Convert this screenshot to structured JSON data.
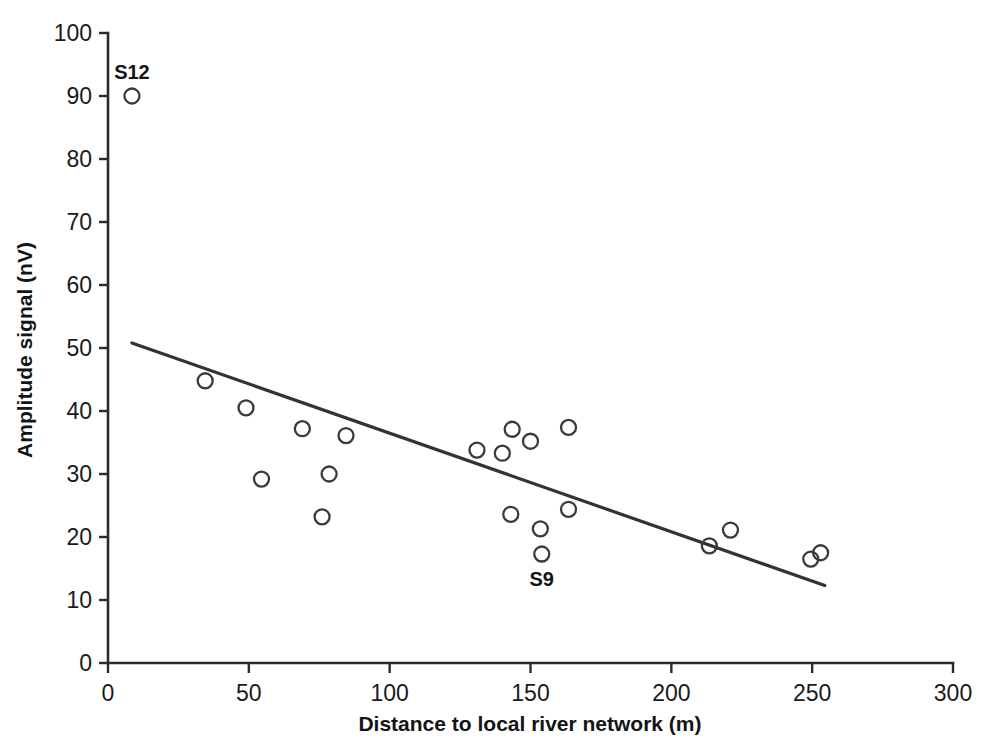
{
  "chart_data": {
    "type": "scatter",
    "title": "",
    "xlabel": "Distance to local river network (m)",
    "ylabel": "Amplitude signal (nV)",
    "xlim": [
      0,
      300
    ],
    "ylim": [
      0,
      100
    ],
    "xticks": [
      0,
      50,
      100,
      150,
      200,
      250,
      300
    ],
    "yticks": [
      0,
      10,
      20,
      30,
      40,
      50,
      60,
      70,
      80,
      90,
      100
    ],
    "xtick_labels": [
      "0",
      "50",
      "100",
      "150",
      "200",
      "250",
      "300"
    ],
    "ytick_labels": [
      "0",
      "10",
      "20",
      "30",
      "40",
      "50",
      "60",
      "70",
      "80",
      "90",
      "100"
    ],
    "grid": false,
    "legend": false,
    "marker": "open-circle",
    "marker_color": "#3a3a3a",
    "series": [
      {
        "name": "Amplitude signal vs distance",
        "points": [
          {
            "x": 8.5,
            "y": 90.0,
            "label": "S12"
          },
          {
            "x": 34.5,
            "y": 44.8,
            "label": ""
          },
          {
            "x": 49.0,
            "y": 40.5,
            "label": ""
          },
          {
            "x": 54.5,
            "y": 29.2,
            "label": ""
          },
          {
            "x": 69.0,
            "y": 37.2,
            "label": ""
          },
          {
            "x": 78.5,
            "y": 30.0,
            "label": ""
          },
          {
            "x": 76.0,
            "y": 23.2,
            "label": ""
          },
          {
            "x": 84.5,
            "y": 36.1,
            "label": ""
          },
          {
            "x": 131.0,
            "y": 33.8,
            "label": ""
          },
          {
            "x": 140.0,
            "y": 33.3,
            "label": ""
          },
          {
            "x": 143.5,
            "y": 37.1,
            "label": ""
          },
          {
            "x": 150.0,
            "y": 35.2,
            "label": ""
          },
          {
            "x": 163.5,
            "y": 37.4,
            "label": ""
          },
          {
            "x": 143.0,
            "y": 23.6,
            "label": ""
          },
          {
            "x": 153.5,
            "y": 21.3,
            "label": ""
          },
          {
            "x": 154.0,
            "y": 17.3,
            "label": "S9"
          },
          {
            "x": 163.5,
            "y": 24.4,
            "label": ""
          },
          {
            "x": 213.5,
            "y": 18.6,
            "label": ""
          },
          {
            "x": 221.0,
            "y": 21.1,
            "label": ""
          },
          {
            "x": 249.5,
            "y": 16.5,
            "label": ""
          },
          {
            "x": 253.0,
            "y": 17.5,
            "label": ""
          }
        ]
      }
    ],
    "trend_line": {
      "name": "linear regression fit",
      "x0": 8.5,
      "y0": 50.8,
      "x1": 254.5,
      "y1": 12.3
    },
    "annotations": [
      {
        "text": "S12",
        "x": 8.5,
        "y": 90.0,
        "position": "above"
      },
      {
        "text": "S9",
        "x": 154.0,
        "y": 17.3,
        "position": "below"
      }
    ]
  }
}
